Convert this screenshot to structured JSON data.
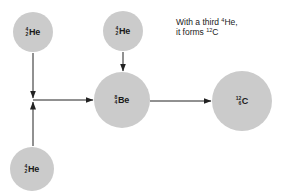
{
  "diagram": {
    "caption": {
      "line1_prefix": "With a third ",
      "line1_sup": "4",
      "line1_suffix": "He,",
      "line2_prefix": "it forms ",
      "line2_sup": "12",
      "line2_suffix": "C"
    },
    "colors": {
      "nucleus_fill": "#cbcbcb",
      "arrow": "#222222",
      "text": "#1a1a1a"
    },
    "nodes": [
      {
        "id": "he-top-left",
        "mass": "4",
        "atomic": "2",
        "symbol": "He"
      },
      {
        "id": "he-top-center",
        "mass": "4",
        "atomic": "2",
        "symbol": "He"
      },
      {
        "id": "he-bottom-left",
        "mass": "4",
        "atomic": "2",
        "symbol": "He"
      },
      {
        "id": "be",
        "mass": "8",
        "atomic": "4",
        "symbol": "Be"
      },
      {
        "id": "c",
        "mass": "12",
        "atomic": "6",
        "symbol": "C"
      }
    ],
    "edges": [
      {
        "from": "he-top-left",
        "to": "junction"
      },
      {
        "from": "he-bottom-left",
        "to": "junction"
      },
      {
        "from": "junction",
        "to": "be"
      },
      {
        "from": "he-top-center",
        "to": "be"
      },
      {
        "from": "be",
        "to": "c"
      }
    ]
  }
}
